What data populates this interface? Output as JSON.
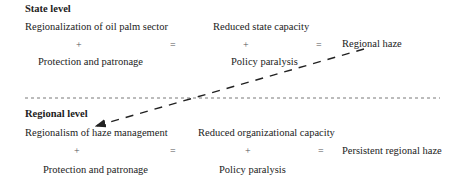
{
  "state_level": {
    "heading": "State level",
    "row_top_left": "Regionalization of oil palm sector",
    "row_top_mid": "Reduced state capacity",
    "plus_left": "+",
    "equals_left": "=",
    "plus_mid": "+",
    "equals_right": "=",
    "result": "Regional haze",
    "row_bottom_left": "Protection and patronage",
    "row_bottom_mid": "Policy paralysis"
  },
  "regional_level": {
    "heading": "Regional level",
    "row_top_left": "Regionalism of haze management",
    "row_top_mid": "Reduced organizational capacity",
    "plus_left": "+",
    "equals_left": "=",
    "plus_mid": "+",
    "equals_right": "=",
    "result": "Persistent regional haze",
    "row_bottom_left": "Protection and patronage",
    "row_bottom_mid": "Policy paralysis"
  },
  "connectors": {
    "separator": "dashed horizontal line between levels",
    "arrow": "dashed arrow from 'Regional haze' down-left to 'Regionalism of haze management'"
  },
  "colors": {
    "text": "#222222",
    "line": "#333333",
    "background": "#ffffff"
  }
}
